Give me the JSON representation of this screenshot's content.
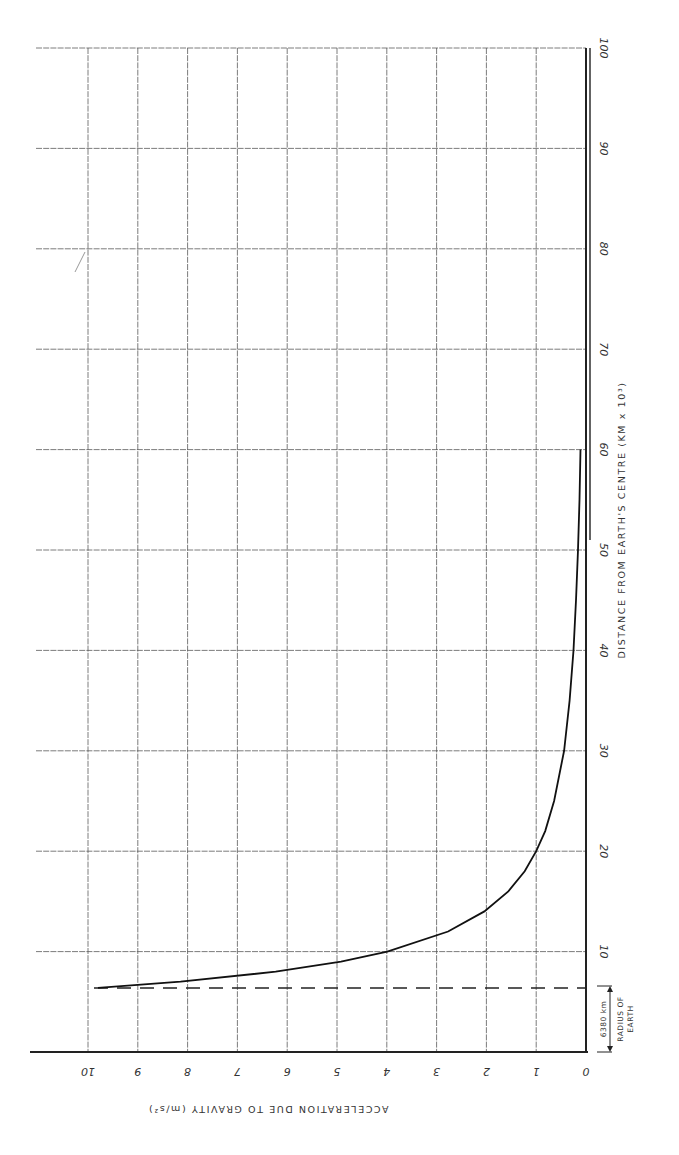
{
  "chart_data": {
    "type": "line",
    "title": "",
    "orientation": "rotated 90° clockwise (distance axis vertical on right, acceleration axis horizontal along bottom, labels rotated)",
    "xlabel": "DISTANCE FROM EARTH'S CENTRE (KM x 10³)",
    "ylabel": "ACCELERATION DUE TO GRAVITY (m/s²)",
    "xlim": [
      0,
      100
    ],
    "ylim": [
      0,
      10
    ],
    "x_ticks": [
      0,
      10,
      20,
      30,
      40,
      50,
      60,
      70,
      80,
      90,
      100
    ],
    "x_tick_labels": [
      "",
      "10",
      "20",
      "30",
      "40",
      "50",
      "60",
      "70",
      "80",
      "90",
      "100"
    ],
    "y_ticks": [
      0,
      1,
      2,
      3,
      4,
      5,
      6,
      7,
      8,
      9,
      10
    ],
    "y_tick_labels": [
      "0",
      "1",
      "2",
      "3",
      "4",
      "5",
      "6",
      "7",
      "8",
      "9",
      "10"
    ],
    "grid": true,
    "legend": null,
    "series": [
      {
        "name": "g vs distance",
        "x": [
          6.38,
          7,
          8,
          9,
          10,
          12,
          14,
          16,
          18,
          20,
          22,
          25,
          30,
          35,
          40,
          45,
          50,
          55,
          60
        ],
        "y": [
          9.8,
          8.14,
          6.23,
          4.92,
          3.99,
          2.77,
          2.04,
          1.56,
          1.23,
          1.0,
          0.82,
          0.64,
          0.44,
          0.33,
          0.25,
          0.2,
          0.16,
          0.13,
          0.11
        ]
      }
    ],
    "annotations": [
      {
        "type": "dashed-line",
        "x": 6.38,
        "label": "6380 km",
        "note": "RADIUS OF EARTH"
      }
    ]
  },
  "labels": {
    "distance_axis_title": "DISTANCE  FROM  EARTH'S  CENTRE    (KM x 10³)",
    "accel_axis_title": "ACCELERATION  DUE  TO  GRAVITY  (m/s²)",
    "radius_value": "6380 km",
    "radius_note_line1": "RADIUS OF",
    "radius_note_line2": "EARTH"
  }
}
